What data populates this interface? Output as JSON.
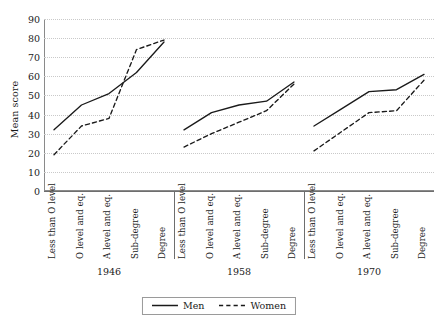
{
  "chart_data": {
    "type": "line",
    "title": "",
    "xlabel": "",
    "ylabel": "Mean score",
    "ylim": [
      0,
      90
    ],
    "ytick_step": 10,
    "yticks": [
      90,
      80,
      70,
      60,
      50,
      40,
      30,
      20,
      10,
      0
    ],
    "grid": "horizontal dotted",
    "legend_position": "bottom-center",
    "categories": [
      "Less than O level",
      "O level and eq.",
      "A level and eq.",
      "Sub-degree",
      "Degree"
    ],
    "groups": [
      {
        "name": "1946",
        "series": [
          {
            "name": "Men",
            "values": [
              32,
              45,
              51,
              62,
              78
            ]
          },
          {
            "name": "Women",
            "values": [
              19,
              34,
              38,
              74,
              79
            ]
          }
        ]
      },
      {
        "name": "1958",
        "series": [
          {
            "name": "Men",
            "values": [
              32,
              41,
              45,
              47,
              57
            ]
          },
          {
            "name": "Women",
            "values": [
              23,
              30,
              36,
              42,
              56
            ]
          }
        ]
      },
      {
        "name": "1970",
        "series": [
          {
            "name": "Men",
            "values": [
              34,
              43,
              52,
              53,
              61
            ]
          },
          {
            "name": "Women",
            "values": [
              21,
              31,
              41,
              42,
              58
            ]
          }
        ]
      }
    ],
    "legend": [
      {
        "label": "Men",
        "style": "solid"
      },
      {
        "label": "Women",
        "style": "dashed"
      }
    ],
    "colors": {
      "line": "#1a1a1a",
      "grid": "#c9c9c9",
      "axis": "#8a8a8a"
    }
  }
}
